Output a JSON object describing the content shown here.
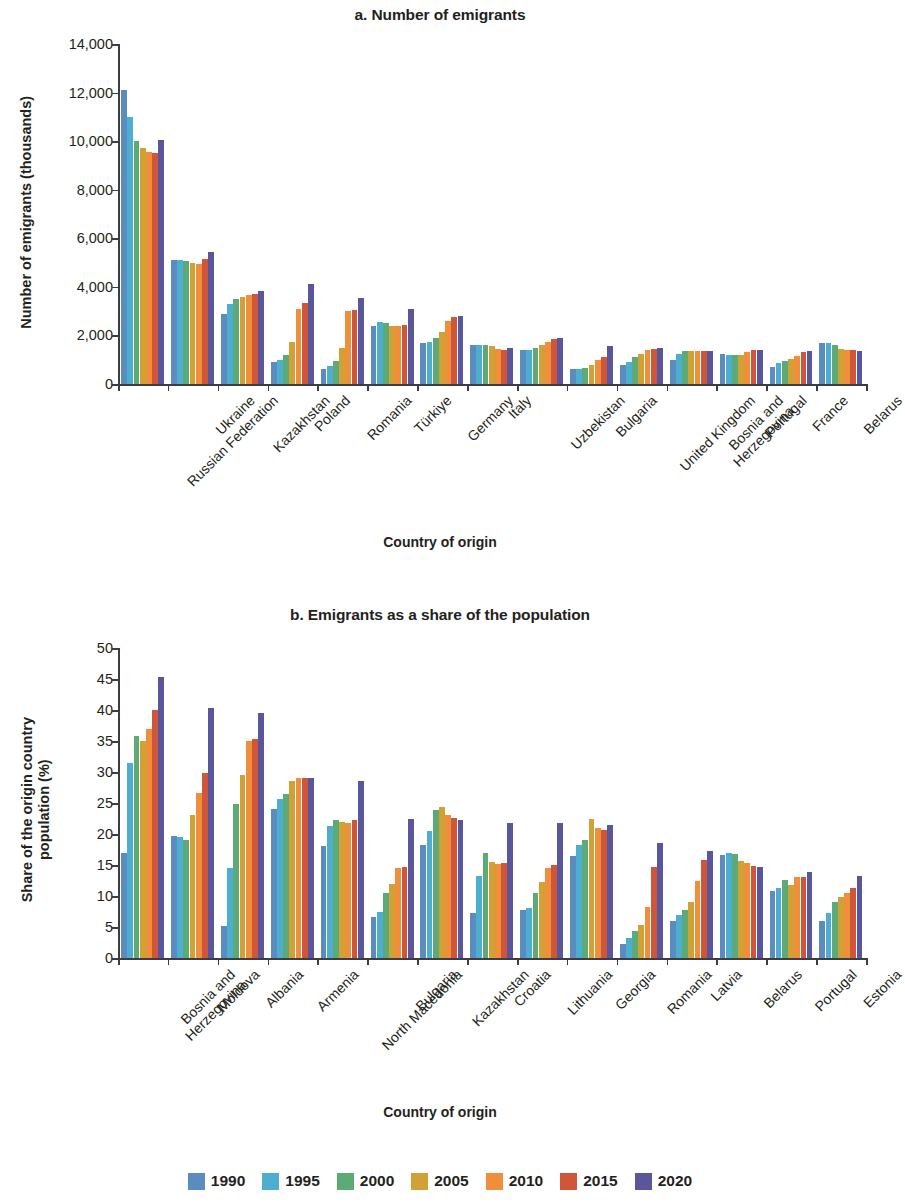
{
  "legend": {
    "position": "bottom-center",
    "entries": [
      {
        "label": "1990",
        "color": "#5b8cc0"
      },
      {
        "label": "1995",
        "color": "#4eaed0"
      },
      {
        "label": "2000",
        "color": "#5cab77"
      },
      {
        "label": "2005",
        "color": "#d1a136"
      },
      {
        "label": "2010",
        "color": "#ef8e3b"
      },
      {
        "label": "2015",
        "color": "#cf5638"
      },
      {
        "label": "2020",
        "color": "#5a569b"
      }
    ]
  },
  "chart_data": [
    {
      "id": "panel-a",
      "type": "bar",
      "title": "a. Number of emigrants",
      "xlabel": "Country of origin",
      "ylabel": "Number of emigrants (thousands)",
      "ylim": [
        0,
        14000
      ],
      "yticks": [
        "0",
        "2,000",
        "4,000",
        "6,000",
        "8,000",
        "10,000",
        "12,000",
        "14,000"
      ],
      "ytick_values": [
        0,
        2000,
        4000,
        6000,
        8000,
        10000,
        12000,
        14000
      ],
      "grid": false,
      "categories": [
        "Russian Federation",
        "Ukraine",
        "Kazakhstan",
        "Poland",
        "Romania",
        "Türkiye",
        "Germany",
        "Italy",
        "Uzbekistan",
        "Bulgaria",
        "United Kingdom",
        "Bosnia and\nHerzegovina",
        "Portugal",
        "France",
        "Belarus"
      ],
      "series": [
        {
          "name": "1990",
          "color": "#5b8cc0",
          "values": [
            12100,
            5100,
            2900,
            900,
            600,
            2400,
            1700,
            1600,
            1400,
            600,
            800,
            1000,
            1250,
            700,
            1700
          ]
        },
        {
          "name": "1995",
          "color": "#4eaed0",
          "values": [
            11000,
            5100,
            3300,
            1000,
            750,
            2550,
            1750,
            1600,
            1400,
            600,
            900,
            1250,
            1200,
            850,
            1700
          ]
        },
        {
          "name": "2000",
          "color": "#5cab77",
          "values": [
            10000,
            5050,
            3500,
            1200,
            950,
            2500,
            1900,
            1600,
            1500,
            650,
            1100,
            1350,
            1200,
            950,
            1600
          ]
        },
        {
          "name": "2005",
          "color": "#d1a136",
          "values": [
            9700,
            5000,
            3600,
            1750,
            1500,
            2400,
            2150,
            1550,
            1600,
            800,
            1250,
            1350,
            1200,
            1050,
            1450
          ]
        },
        {
          "name": "2010",
          "color": "#ef8e3b",
          "values": [
            9550,
            4950,
            3650,
            3100,
            3000,
            2400,
            2600,
            1450,
            1750,
            1000,
            1400,
            1350,
            1300,
            1150,
            1400
          ]
        },
        {
          "name": "2015",
          "color": "#cf5638",
          "values": [
            9500,
            5150,
            3700,
            3350,
            3050,
            2450,
            2750,
            1400,
            1850,
            1100,
            1450,
            1350,
            1400,
            1300,
            1400
          ]
        },
        {
          "name": "2020",
          "color": "#5a569b",
          "values": [
            10050,
            5450,
            3850,
            4100,
            3550,
            3100,
            2800,
            1500,
            1900,
            1550,
            1500,
            1350,
            1400,
            1350,
            1350
          ]
        }
      ]
    },
    {
      "id": "panel-b",
      "type": "bar",
      "title": "b. Emigrants as a share of the population",
      "xlabel": "Country of origin",
      "ylabel": "Share of the origin country\npopulation (%)",
      "ylim": [
        0,
        50
      ],
      "yticks": [
        "0",
        "5",
        "10",
        "15",
        "20",
        "25",
        "30",
        "35",
        "40",
        "45",
        "50"
      ],
      "ytick_values": [
        0,
        5,
        10,
        15,
        20,
        25,
        30,
        35,
        40,
        45,
        50
      ],
      "grid": false,
      "categories": [
        "Bosnia and\nHerzegovina",
        "Moldova",
        "Albania",
        "Armenia",
        "North Macedonia",
        "Bulgaria",
        "Kazakhstan",
        "Croatia",
        "Lithuania",
        "Georgia",
        "Romania",
        "Latvia",
        "Belarus",
        "Portugal",
        "Estonia"
      ],
      "series": [
        {
          "name": "1990",
          "color": "#5b8cc0",
          "values": [
            17.0,
            19.6,
            5.2,
            24.0,
            18.0,
            6.6,
            18.2,
            7.3,
            7.8,
            16.5,
            2.2,
            6.0,
            16.6,
            10.8,
            6.0
          ]
        },
        {
          "name": "1995",
          "color": "#4eaed0",
          "values": [
            31.5,
            19.5,
            14.5,
            25.6,
            21.3,
            7.4,
            20.5,
            13.3,
            8.0,
            18.3,
            3.2,
            7.0,
            17.0,
            11.3,
            7.3
          ]
        },
        {
          "name": "2000",
          "color": "#5cab77",
          "values": [
            35.8,
            19.0,
            24.8,
            26.5,
            22.3,
            10.5,
            23.8,
            17.0,
            10.5,
            19.0,
            4.3,
            7.8,
            16.7,
            12.6,
            9.0
          ]
        },
        {
          "name": "2005",
          "color": "#d1a136",
          "values": [
            35.0,
            23.0,
            29.5,
            28.5,
            22.0,
            12.0,
            24.3,
            15.5,
            12.2,
            22.5,
            5.3,
            9.0,
            15.6,
            11.8,
            9.8
          ]
        },
        {
          "name": "2010",
          "color": "#ef8e3b",
          "values": [
            37.0,
            26.6,
            35.0,
            29.0,
            21.7,
            14.5,
            23.0,
            15.2,
            14.5,
            21.0,
            8.2,
            12.4,
            15.3,
            13.1,
            10.5
          ]
        },
        {
          "name": "2015",
          "color": "#cf5638",
          "values": [
            40.0,
            29.8,
            35.4,
            29.0,
            22.3,
            14.7,
            22.6,
            15.4,
            15.0,
            20.6,
            14.7,
            15.8,
            14.8,
            13.0,
            11.3
          ]
        },
        {
          "name": "2020",
          "color": "#5a569b",
          "values": [
            45.4,
            40.4,
            39.5,
            29.0,
            28.6,
            22.4,
            22.2,
            21.8,
            21.8,
            21.5,
            18.6,
            17.3,
            14.7,
            13.9,
            13.3
          ]
        }
      ]
    }
  ]
}
